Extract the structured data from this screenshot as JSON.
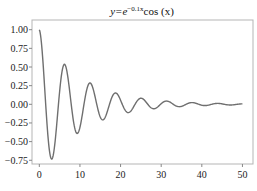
{
  "chart_data": {
    "type": "line",
    "title_parts": {
      "base": "y=e",
      "exponent": "−0.1x",
      "tail": "cos (x)"
    },
    "xlabel": "",
    "ylabel": "",
    "xlim": [
      -1.8,
      52.6
    ],
    "ylim": [
      -0.8,
      1.13
    ],
    "x_ticks": [
      0,
      10,
      20,
      30,
      40,
      50
    ],
    "x_tick_labels": [
      "0",
      "10",
      "20",
      "30",
      "40",
      "50"
    ],
    "y_ticks": [
      1.0,
      0.75,
      0.5,
      0.25,
      0.0,
      -0.25,
      -0.5,
      -0.75
    ],
    "y_tick_labels": [
      "1.00",
      "0.75",
      "0.50",
      "0.25",
      "0.00",
      "−0.25",
      "−0.50",
      "−0.75"
    ],
    "grid": false,
    "legend": null,
    "series": [
      {
        "name": "e^{-0.1x}cos(x)",
        "function": "exp(-0.1*x)*cos(x)",
        "x_range": [
          0,
          50
        ],
        "samples": 500,
        "color": "#6f6f6f",
        "x": [
          0,
          3.14,
          6.28,
          9.42,
          12.57,
          15.71,
          18.85,
          21.99,
          25.13,
          28.27,
          31.42,
          34.56,
          37.7,
          40.84,
          43.98,
          47.12,
          50
        ],
        "y": [
          1.0,
          -0.73,
          0.53,
          -0.39,
          0.28,
          -0.21,
          0.15,
          -0.11,
          0.08,
          -0.06,
          0.04,
          -0.03,
          0.02,
          -0.02,
          0.01,
          -0.01,
          0.0065
        ]
      }
    ]
  },
  "colors": {
    "frame": "#b5b5b5",
    "curve": "#6f6f6f",
    "tick": "#888888",
    "text": "#222222"
  }
}
